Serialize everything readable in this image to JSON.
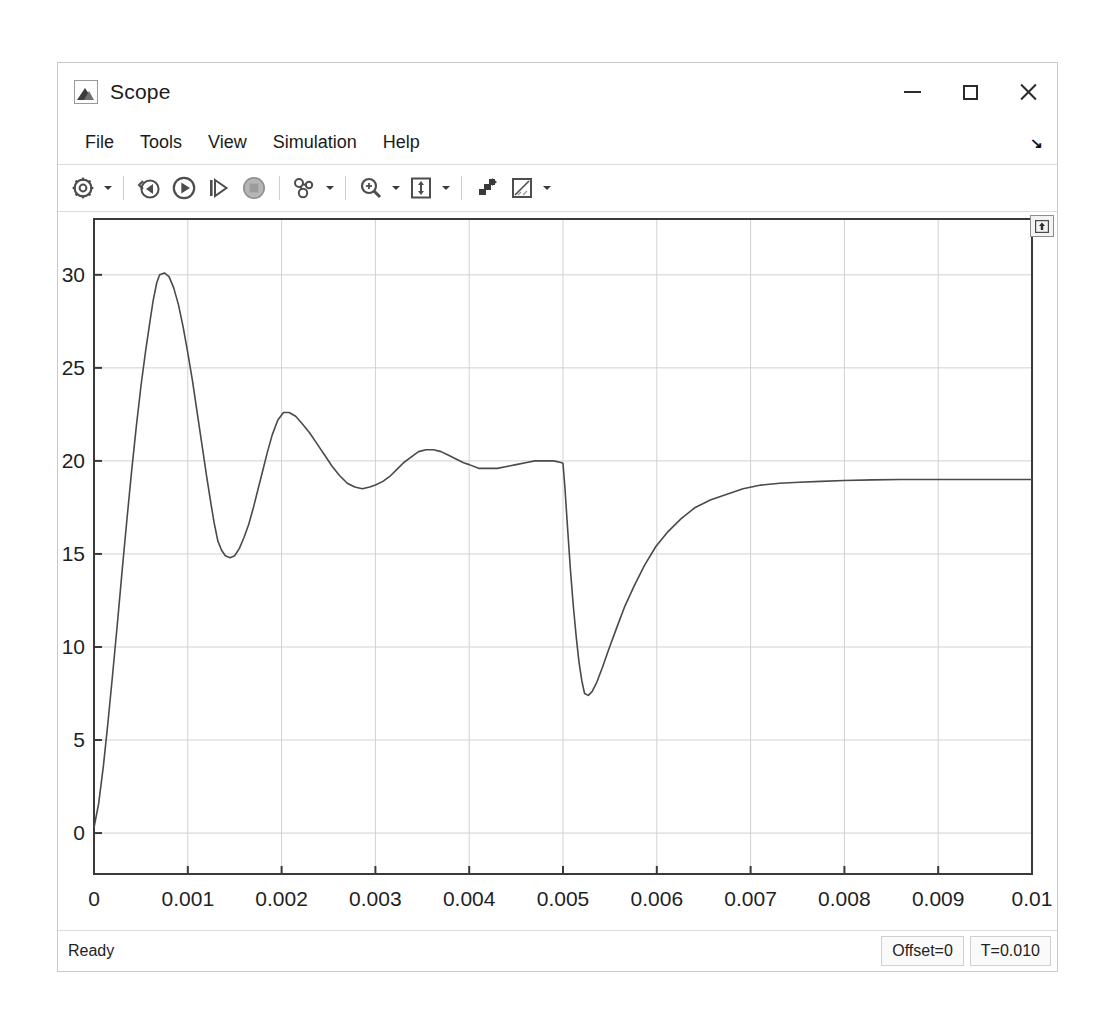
{
  "window": {
    "title": "Scope",
    "icon": "matlab-scope-icon",
    "controls": {
      "minimize": "–",
      "maximize": "□",
      "close": "×"
    }
  },
  "menubar": {
    "items": [
      {
        "label": "File"
      },
      {
        "label": "Tools"
      },
      {
        "label": "View"
      },
      {
        "label": "Simulation"
      },
      {
        "label": "Help"
      }
    ],
    "expand_glyph": "↘"
  },
  "toolbar": {
    "buttons": [
      {
        "name": "configuration-properties-icon",
        "title": "Configuration Properties",
        "has_caret": true
      },
      {
        "name": "run-back-to-start-icon",
        "title": "Rewind",
        "has_caret": false
      },
      {
        "name": "run-icon",
        "title": "Run",
        "has_caret": false
      },
      {
        "name": "step-forward-icon",
        "title": "Step Forward",
        "has_caret": false
      },
      {
        "name": "stop-icon",
        "title": "Stop",
        "has_caret": false
      },
      {
        "name": "simulation-stepping-options-icon",
        "title": "Simulation Stepping Options",
        "has_caret": true
      },
      {
        "name": "zoom-in-icon",
        "title": "Zoom In",
        "has_caret": true
      },
      {
        "name": "autoscale-icon",
        "title": "Autoscale",
        "has_caret": true
      },
      {
        "name": "cursor-measurements-icon",
        "title": "Cursor Measurements",
        "has_caret": false
      },
      {
        "name": "measurements-ruler-icon",
        "title": "Measurements",
        "has_caret": true
      }
    ]
  },
  "plot": {
    "panel_toggle_icon": "expand-panel-up-icon"
  },
  "statusbar": {
    "ready_label": "Ready",
    "offset_label": "Offset=0",
    "time_label": "T=0.010"
  },
  "chart_data": {
    "type": "line",
    "title": "",
    "xlabel": "",
    "ylabel": "",
    "xlim": [
      0,
      0.01
    ],
    "ylim": [
      -2.2,
      33.0
    ],
    "grid": true,
    "legend": null,
    "xticks": [
      0,
      0.001,
      0.002,
      0.003,
      0.004,
      0.005,
      0.006,
      0.007,
      0.008,
      0.009,
      0.01
    ],
    "xticklabels": [
      "0",
      "0.001",
      "0.002",
      "0.003",
      "0.004",
      "0.005",
      "0.006",
      "0.007",
      "0.008",
      "0.009",
      "0.01"
    ],
    "yticks": [
      0,
      5,
      10,
      15,
      20,
      25,
      30
    ],
    "yticklabels": [
      "0",
      "5",
      "10",
      "15",
      "20",
      "25",
      "30"
    ],
    "line_color": "#4a4a4a",
    "line_width": 1.6,
    "annotations": [
      {
        "label": "first overshoot peak",
        "x": 0.00063,
        "y": 30.1
      },
      {
        "label": "first undershoot",
        "x": 0.00128,
        "y": 14.8
      },
      {
        "label": "second overshoot peak",
        "x": 0.00196,
        "y": 22.6
      },
      {
        "label": "pre-disturbance steady state",
        "x": 0.005,
        "y": 19.8
      },
      {
        "label": "load disturbance dip",
        "x": 0.00523,
        "y": 7.4
      },
      {
        "label": "final steady state",
        "x": 0.01,
        "y": 19.0
      }
    ],
    "series": [
      {
        "name": "Speed",
        "x": [
          0.0,
          5e-05,
          0.0001,
          0.00015,
          0.0002,
          0.00025,
          0.0003,
          0.00035,
          0.0004,
          0.00045,
          0.0005,
          0.00055,
          0.0006,
          0.00063,
          0.00067,
          0.0007,
          0.00075,
          0.0008,
          0.00085,
          0.0009,
          0.00095,
          0.001,
          0.00105,
          0.0011,
          0.00115,
          0.0012,
          0.00125,
          0.00128,
          0.00132,
          0.00136,
          0.0014,
          0.00145,
          0.0015,
          0.00155,
          0.0016,
          0.00165,
          0.0017,
          0.00175,
          0.0018,
          0.00185,
          0.0019,
          0.00196,
          0.00202,
          0.00208,
          0.00215,
          0.00222,
          0.0023,
          0.00238,
          0.00246,
          0.00254,
          0.00262,
          0.0027,
          0.00278,
          0.00286,
          0.00294,
          0.003,
          0.00308,
          0.00316,
          0.00324,
          0.0033,
          0.00338,
          0.00346,
          0.00354,
          0.00362,
          0.0037,
          0.00378,
          0.00386,
          0.00394,
          0.004,
          0.0041,
          0.0042,
          0.0043,
          0.0044,
          0.0045,
          0.0046,
          0.0047,
          0.0048,
          0.0049,
          0.00499,
          0.005,
          0.00502,
          0.00505,
          0.00508,
          0.00511,
          0.00514,
          0.00517,
          0.0052,
          0.00523,
          0.00527,
          0.00531,
          0.00536,
          0.00542,
          0.00549,
          0.00557,
          0.00566,
          0.00576,
          0.00587,
          0.00599,
          0.00612,
          0.00626,
          0.00641,
          0.00657,
          0.00674,
          0.00692,
          0.00711,
          0.00731,
          0.00752,
          0.00775,
          0.008,
          0.0083,
          0.0086,
          0.0089,
          0.0092,
          0.0095,
          0.0098,
          0.01
        ],
        "y": [
          0.3,
          1.6,
          3.6,
          6.0,
          8.6,
          11.3,
          14.1,
          16.8,
          19.4,
          21.8,
          24.0,
          25.9,
          27.6,
          28.6,
          29.6,
          30.0,
          30.1,
          29.9,
          29.3,
          28.4,
          27.2,
          25.8,
          24.3,
          22.6,
          20.9,
          19.2,
          17.6,
          16.7,
          15.7,
          15.2,
          14.9,
          14.8,
          14.9,
          15.3,
          15.9,
          16.6,
          17.5,
          18.5,
          19.5,
          20.5,
          21.4,
          22.2,
          22.6,
          22.6,
          22.4,
          22.0,
          21.5,
          20.9,
          20.3,
          19.7,
          19.2,
          18.8,
          18.6,
          18.5,
          18.6,
          18.7,
          18.9,
          19.2,
          19.6,
          19.9,
          20.2,
          20.5,
          20.6,
          20.6,
          20.5,
          20.3,
          20.1,
          19.9,
          19.8,
          19.6,
          19.6,
          19.6,
          19.7,
          19.8,
          19.9,
          20.0,
          20.0,
          20.0,
          19.9,
          19.85,
          18.6,
          16.3,
          14.1,
          12.2,
          10.6,
          9.2,
          8.2,
          7.5,
          7.4,
          7.6,
          8.1,
          8.9,
          9.9,
          11.0,
          12.2,
          13.3,
          14.4,
          15.4,
          16.2,
          16.9,
          17.5,
          17.9,
          18.2,
          18.5,
          18.7,
          18.8,
          18.85,
          18.9,
          18.95,
          18.98,
          19.0,
          19.0,
          19.0,
          19.0,
          19.0,
          19.0
        ]
      }
    ]
  }
}
